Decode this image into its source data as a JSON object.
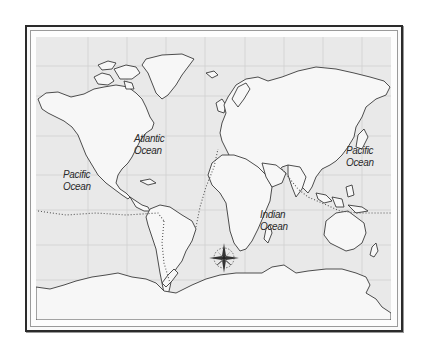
{
  "map": {
    "type": "world-outline-map",
    "projection": "equirectangular-like",
    "colors": {
      "land": "#f7f7f7",
      "ocean": "#e9e9e9",
      "coastline": "#3a3a3a",
      "gridline": "#cfcfcf",
      "route": "#555555",
      "frame": "#2b2b2b"
    },
    "labels": [
      {
        "id": "atlantic",
        "line1": "Atlantic",
        "line2": "Ocean"
      },
      {
        "id": "pacific-west",
        "line1": "Pacific",
        "line2": "Ocean"
      },
      {
        "id": "indian",
        "line1": "Indian",
        "line2": "Ocean"
      },
      {
        "id": "pacific-east",
        "line1": "Pacific",
        "line2": "Ocean"
      }
    ],
    "features": [
      "compass-rose",
      "dotted-shipping-routes",
      "graticule-gridlines",
      "double-line-frame"
    ]
  }
}
